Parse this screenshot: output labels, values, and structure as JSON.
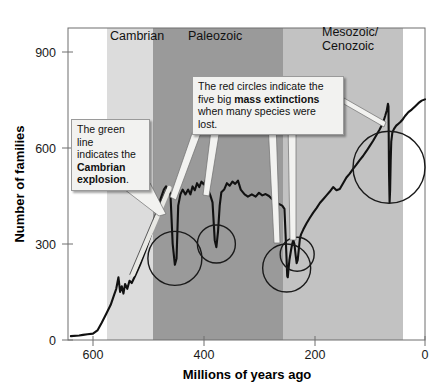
{
  "chart_data": {
    "type": "line",
    "title": "",
    "xlabel": "Millions of years ago",
    "ylabel": "Number of families",
    "xlim": [
      640,
      0
    ],
    "ylim": [
      0,
      1000
    ],
    "x_ticks": [
      600,
      400,
      200,
      0
    ],
    "y_ticks": [
      0,
      300,
      600,
      900
    ],
    "grid": false,
    "legend": "none",
    "x_axis_direction": "reversed",
    "series": [
      {
        "name": "Number of marine families",
        "color": "#111111",
        "points": [
          [
            640,
            12
          ],
          [
            625,
            14
          ],
          [
            618,
            16
          ],
          [
            610,
            18
          ],
          [
            600,
            20
          ],
          [
            592,
            30
          ],
          [
            584,
            55
          ],
          [
            576,
            82
          ],
          [
            568,
            110
          ],
          [
            562,
            140
          ],
          [
            558,
            160
          ],
          [
            554,
            196
          ],
          [
            551,
            150
          ],
          [
            548,
            168
          ],
          [
            545,
            145
          ],
          [
            542,
            175
          ],
          [
            538,
            160
          ],
          [
            534,
            185
          ],
          [
            530,
            178
          ],
          [
            524,
            200
          ],
          [
            515,
            235
          ],
          [
            505,
            280
          ],
          [
            495,
            330
          ],
          [
            485,
            390
          ],
          [
            478,
            440
          ],
          [
            472,
            470
          ],
          [
            468,
            480
          ],
          [
            464,
            470
          ],
          [
            460,
            455
          ],
          [
            456,
            300
          ],
          [
            452,
            235
          ],
          [
            449,
            255
          ],
          [
            446,
            420
          ],
          [
            442,
            455
          ],
          [
            438,
            470
          ],
          [
            433,
            455
          ],
          [
            428,
            470
          ],
          [
            424,
            455
          ],
          [
            420,
            480
          ],
          [
            416,
            468
          ],
          [
            412,
            490
          ],
          [
            408,
            478
          ],
          [
            404,
            495
          ],
          [
            400,
            486
          ],
          [
            396,
            500
          ],
          [
            392,
            470
          ],
          [
            388,
            452
          ],
          [
            384,
            430
          ],
          [
            380,
            312
          ],
          [
            377,
            290
          ],
          [
            374,
            340
          ],
          [
            371,
            420
          ],
          [
            368,
            462
          ],
          [
            363,
            470
          ],
          [
            358,
            490
          ],
          [
            353,
            482
          ],
          [
            348,
            495
          ],
          [
            343,
            488
          ],
          [
            338,
            498
          ],
          [
            333,
            470
          ],
          [
            326,
            455
          ],
          [
            320,
            448
          ],
          [
            313,
            455
          ],
          [
            306,
            448
          ],
          [
            300,
            460
          ],
          [
            294,
            452
          ],
          [
            288,
            456
          ],
          [
            282,
            450
          ],
          [
            276,
            440
          ],
          [
            270,
            432
          ],
          [
            264,
            425
          ],
          [
            258,
            420
          ],
          [
            254,
            410
          ],
          [
            252,
            330
          ],
          [
            250,
            245
          ],
          [
            249,
            200
          ],
          [
            248,
            196
          ],
          [
            247,
            215
          ],
          [
            245,
            250
          ],
          [
            242,
            282
          ],
          [
            240,
            300
          ],
          [
            238,
            312
          ],
          [
            236,
            300
          ],
          [
            234,
            268
          ],
          [
            232,
            240
          ],
          [
            230,
            250
          ],
          [
            228,
            285
          ],
          [
            226,
            318
          ],
          [
            224,
            330
          ],
          [
            220,
            345
          ],
          [
            214,
            365
          ],
          [
            208,
            382
          ],
          [
            202,
            398
          ],
          [
            196,
            412
          ],
          [
            190,
            428
          ],
          [
            184,
            440
          ],
          [
            178,
            452
          ],
          [
            172,
            464
          ],
          [
            166,
            478
          ],
          [
            160,
            468
          ],
          [
            154,
            472
          ],
          [
            148,
            490
          ],
          [
            142,
            508
          ],
          [
            136,
            520
          ],
          [
            130,
            535
          ],
          [
            124,
            548
          ],
          [
            118,
            562
          ],
          [
            112,
            575
          ],
          [
            106,
            590
          ],
          [
            100,
            606
          ],
          [
            94,
            622
          ],
          [
            88,
            640
          ],
          [
            82,
            658
          ],
          [
            76,
            678
          ],
          [
            72,
            700
          ],
          [
            69,
            718
          ],
          [
            67,
            738
          ],
          [
            66,
            730
          ],
          [
            65,
            520
          ],
          [
            64,
            430
          ],
          [
            63,
            470
          ],
          [
            62,
            560
          ],
          [
            61,
            620
          ],
          [
            59,
            648
          ],
          [
            56,
            660
          ],
          [
            52,
            670
          ],
          [
            48,
            676
          ],
          [
            44,
            682
          ],
          [
            40,
            690
          ],
          [
            36,
            700
          ],
          [
            30,
            712
          ],
          [
            24,
            720
          ],
          [
            18,
            730
          ],
          [
            12,
            740
          ],
          [
            6,
            748
          ],
          [
            0,
            752
          ]
        ]
      }
    ],
    "highlight_line": {
      "name": "cambrian-explosion-line",
      "color_name": "green",
      "color": "#e8e8e4",
      "description": "Light stroke marking the steep Cambrian explosion rise",
      "from": [
        528,
        205
      ],
      "to": [
        462,
        475
      ]
    },
    "extinction_circles": [
      {
        "label": "Late Ordovician",
        "x": 452,
        "y": 255,
        "radius_px": 27
      },
      {
        "label": "Late Devonian",
        "x": 377,
        "y": 300,
        "radius_px": 19
      },
      {
        "label": "Permian-Triassic",
        "x": 250,
        "y": 225,
        "radius_px": 24
      },
      {
        "label": "Triassic-Jurassic",
        "x": 231,
        "y": 268,
        "radius_px": 17
      },
      {
        "label": "Cretaceous-Paleogene",
        "x": 65,
        "y": 540,
        "radius_px": 36
      }
    ],
    "era_bands": [
      {
        "label": "Cambrian",
        "from": 542,
        "to": 488,
        "color": "#dcdcdc"
      },
      {
        "label": "Paleozoic",
        "from": 488,
        "to": 252,
        "color": "#9a9a9a"
      },
      {
        "label": "Mesozoic/\nCenozoic",
        "from": 252,
        "to": 23,
        "color": "#c2c2c2"
      }
    ]
  },
  "axes": {
    "y_title": "Number of families",
    "x_title": "Millions of years ago",
    "y_tick_labels": [
      "900",
      "600",
      "300",
      "0"
    ],
    "x_tick_labels": [
      "600",
      "400",
      "200",
      "0"
    ]
  },
  "bands": {
    "cambrian": "Cambrian",
    "paleozoic": "Paleozoic",
    "mesozoic_line1": "Mesozoic/",
    "mesozoic_line2": "Cenozoic"
  },
  "callouts": {
    "green_line": {
      "text_part1": "The green line",
      "text_part2": "indicates the",
      "bold_part1": "Cambrian",
      "bold_part2": "explosion",
      "text_end": "."
    },
    "red_circles": {
      "text_part1": "The red circles indicate the",
      "text_part2": "five big ",
      "bold_part": "mass extinctions",
      "text_part3": "when many species were lost."
    }
  },
  "colors": {
    "curve": "#111111",
    "circle_stroke": "#1a1a1a",
    "callout_bg": "#f2f2f0",
    "callout_border": "#9a9a9a",
    "plot_border": "#6e6e6e",
    "band_cambrian": "#dcdcdc",
    "band_paleozoic": "#9a9a9a",
    "band_mesozoic": "#c2c2c2",
    "highlight_line": "#e8e8e4"
  }
}
